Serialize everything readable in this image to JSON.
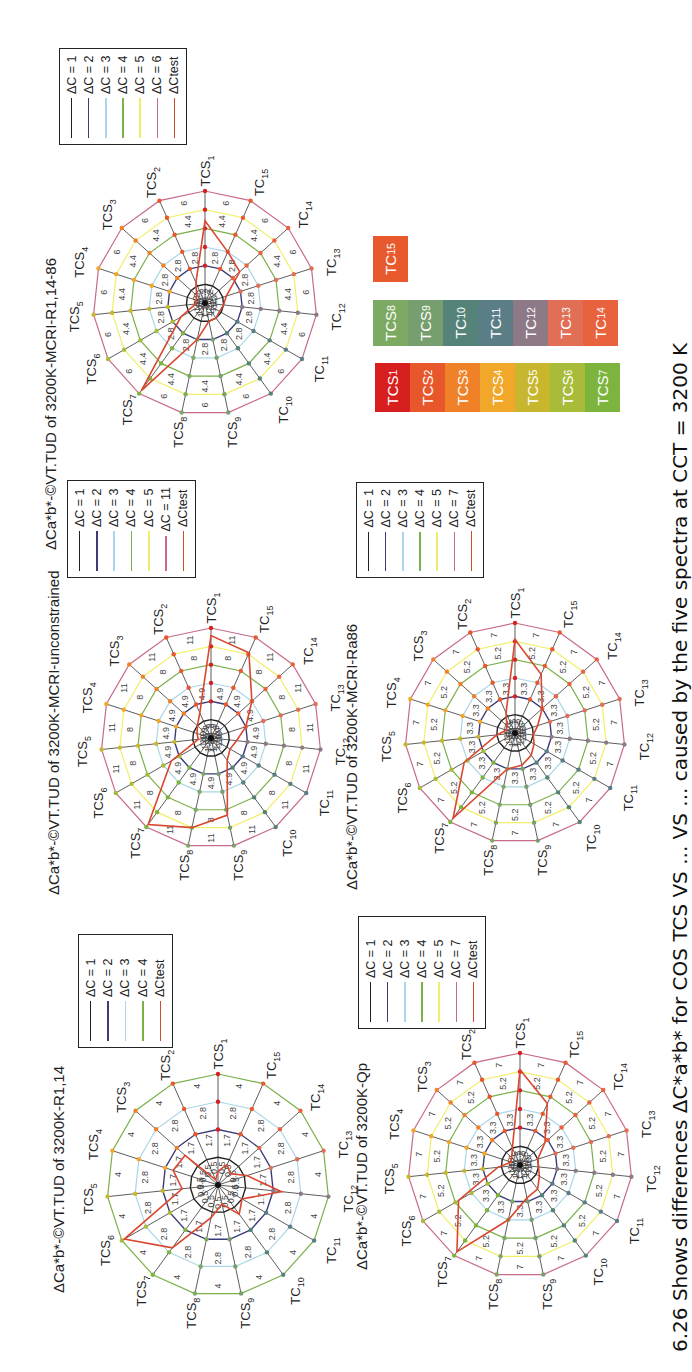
{
  "caption": "6.26 Shows differences ΔC*a*b* for COS TCS VS ... VS ... caused by the five spectra at CCT = 3200 K",
  "axes": [
    "TCS1",
    "TCS2",
    "TCS3",
    "TCS4",
    "TCS5",
    "TCS6",
    "TCS7",
    "TCS8",
    "TCS9",
    "TC10",
    "TC11",
    "TC12",
    "TC13",
    "TC14",
    "TC15"
  ],
  "ring_colors": {
    "1": "#222222",
    "2": "#3b3b7a",
    "3": "#a9d6e8",
    "4": "#7bb04a",
    "5": "#f2ee6a",
    "outer": "#c86a8a",
    "test": "#d9472f"
  },
  "swatches": {
    "single": [
      {
        "label": "TC15",
        "color": "#e85a2e"
      }
    ],
    "row2": [
      {
        "label": "TCS8",
        "color": "#7daa62"
      },
      {
        "label": "TCS9",
        "color": "#779e6e"
      },
      {
        "label": "TC10",
        "color": "#55837a"
      },
      {
        "label": "TC11",
        "color": "#5b7e86"
      },
      {
        "label": "TC12",
        "color": "#8d7a86"
      },
      {
        "label": "TC13",
        "color": "#e06f55"
      },
      {
        "label": "TC14",
        "color": "#e8623e"
      }
    ],
    "row3": [
      {
        "label": "TCS1",
        "color": "#d81f1f"
      },
      {
        "label": "TCS2",
        "color": "#e8562c"
      },
      {
        "label": "TCS3",
        "color": "#ef8228"
      },
      {
        "label": "TCS4",
        "color": "#f0a72a"
      },
      {
        "label": "TCS5",
        "color": "#c8b62e"
      },
      {
        "label": "TCS6",
        "color": "#a8bc3a"
      },
      {
        "label": "TCS7",
        "color": "#7db43e"
      }
    ]
  },
  "chart_data": [
    {
      "type": "radar",
      "title": "ΔCa*b*-©VT.TUD of 3200K-MCRI-R1,14-86",
      "categories": [
        "TCS1",
        "TCS2",
        "TCS3",
        "TCS4",
        "TCS5",
        "TCS6",
        "TCS7",
        "TCS8",
        "TCS9",
        "TC10",
        "TC11",
        "TC12",
        "TC13",
        "TC14",
        "TC15"
      ],
      "rings": [
        1,
        2,
        3,
        4,
        5,
        6
      ],
      "ring_labels": [
        "1.2",
        "2.8",
        "4.4",
        "6"
      ],
      "max": 6,
      "legend": [
        "ΔC = 1",
        "ΔC = 2",
        "ΔC = 3",
        "ΔC = 4",
        "ΔC = 5",
        "ΔC = 6",
        "ΔCtest"
      ],
      "series": [
        {
          "name": "ΔCtest",
          "values": [
            4.4,
            1.2,
            0.6,
            0.5,
            0.5,
            1.5,
            5.8,
            2.0,
            1.0,
            1.0,
            0.9,
            1.0,
            1.2,
            2.5,
            3.0
          ]
        }
      ]
    },
    {
      "type": "radar",
      "title": "ΔCa*b*-©VT.TUD of 3200K-MCRI-unconstrained",
      "categories": [
        "TCS1",
        "TCS2",
        "TCS3",
        "TCS4",
        "TCS5",
        "TCS6",
        "TCS7",
        "TCS8",
        "TCS9",
        "TC10",
        "TC11",
        "TC12",
        "TC13",
        "TC14",
        "TC15"
      ],
      "rings": [
        1,
        2,
        3,
        4,
        5,
        11
      ],
      "ring_labels": [
        "1.9",
        "4.9",
        "8",
        "11"
      ],
      "max": 11,
      "legend": [
        "ΔC = 1",
        "ΔC = 2",
        "ΔC = 3",
        "ΔC = 4",
        "ΔC = 5",
        "ΔC = 11",
        "ΔCtest"
      ],
      "series": [
        {
          "name": "ΔCtest",
          "values": [
            8.5,
            1.5,
            1.0,
            0.8,
            0.7,
            2.5,
            10.0,
            5.0,
            4.3,
            1.5,
            1.2,
            1.4,
            2.0,
            3.0,
            5.5
          ]
        }
      ]
    },
    {
      "type": "radar",
      "title": "ΔCa*b*-©VT.TUD of 3200K-MCRI-Ra86",
      "categories": [
        "TCS1",
        "TCS2",
        "TCS3",
        "TCS4",
        "TCS5",
        "TCS6",
        "TCS7",
        "TCS8",
        "TCS9",
        "TC10",
        "TC11",
        "TC12",
        "TC13",
        "TC14",
        "TC15"
      ],
      "rings": [
        1,
        2,
        3,
        4,
        5,
        7
      ],
      "ring_labels": [
        "1.5",
        "3.3",
        "5.2",
        "7"
      ],
      "max": 7,
      "legend": [
        "ΔC = 1",
        "ΔC = 2",
        "ΔC = 3",
        "ΔC = 4",
        "ΔC = 5",
        "ΔC = 7",
        "ΔCtest"
      ],
      "series": [
        {
          "name": "ΔCtest",
          "values": [
            5.2,
            1.2,
            0.6,
            0.5,
            1.0,
            3.2,
            6.5,
            2.0,
            1.8,
            1.5,
            1.2,
            1.0,
            1.3,
            2.0,
            3.5
          ]
        }
      ]
    },
    {
      "type": "radar",
      "title": "ΔCa*b*-©VT.TUD of 3200K-R1,14",
      "categories": [
        "TCS1",
        "TCS2",
        "TCS3",
        "TCS4",
        "TCS5",
        "TCS6",
        "TCS7",
        "TCS8",
        "TCS9",
        "TC10",
        "TC11",
        "TC12",
        "TC13",
        "TC14",
        "TC15"
      ],
      "rings": [
        1,
        2,
        3,
        4
      ],
      "ring_labels": [
        "0.5",
        "1.7",
        "2.8",
        "4"
      ],
      "max": 4,
      "legend": [
        "ΔC = 1",
        "ΔC = 2",
        "ΔC = 3",
        "ΔC = 4",
        "ΔCtest"
      ],
      "series": [
        {
          "name": "ΔCtest",
          "values": [
            0.5,
            0.2,
            1.6,
            1.7,
            1.3,
            3.9,
            2.8,
            1.2,
            0.7,
            1.3,
            1.0,
            2.3,
            1.1,
            0.6,
            0.8
          ]
        }
      ]
    },
    {
      "type": "radar",
      "title": "ΔCa*b*-©VT.TUD of 3200K-Qp",
      "categories": [
        "TCS1",
        "TCS2",
        "TCS3",
        "TCS4",
        "TCS5",
        "TCS6",
        "TCS7",
        "TCS8",
        "TCS9",
        "TC10",
        "TC11",
        "TC12",
        "TC13",
        "TC14",
        "TC15"
      ],
      "rings": [
        1,
        2,
        3,
        4,
        5,
        7
      ],
      "ring_labels": [
        "1.5",
        "3.3",
        "5.2",
        "7"
      ],
      "max": 7,
      "legend": [
        "ΔC = 1",
        "ΔC = 2",
        "ΔC = 3",
        "ΔC = 4",
        "ΔC = 5",
        "ΔC = 7",
        "ΔCtest"
      ],
      "series": [
        {
          "name": "ΔCtest",
          "values": [
            5.2,
            1.0,
            0.6,
            0.5,
            1.2,
            3.8,
            6.5,
            3.0,
            1.8,
            1.6,
            1.2,
            1.0,
            1.0,
            1.8,
            3.6
          ]
        }
      ]
    }
  ],
  "layout_charts": [
    {
      "cx": 1069,
      "cy": 205,
      "r": 112,
      "title_x": 822,
      "title_y": 42,
      "legend": {
        "x": 1227,
        "y": 59,
        "w": 97,
        "h": 128
      }
    },
    {
      "cx": 634,
      "cy": 211,
      "r": 110,
      "title_x": 477,
      "title_y": 45,
      "legend": {
        "x": 794,
        "y": 67,
        "w": 98,
        "h": 129
      }
    },
    {
      "cx": 639,
      "cy": 515,
      "r": 110,
      "title_x": 482,
      "title_y": 343,
      "legend": {
        "x": 794,
        "y": 356,
        "w": 96,
        "h": 128
      }
    },
    {
      "cx": 187,
      "cy": 218,
      "r": 111,
      "title_x": 79,
      "title_y": 50,
      "legend": {
        "x": 324,
        "y": 78,
        "w": 114,
        "h": 95
      }
    },
    {
      "cx": 207,
      "cy": 520,
      "r": 112,
      "title_x": 102,
      "title_y": 353,
      "legend": {
        "x": 343,
        "y": 358,
        "w": 113,
        "h": 128
      }
    }
  ]
}
